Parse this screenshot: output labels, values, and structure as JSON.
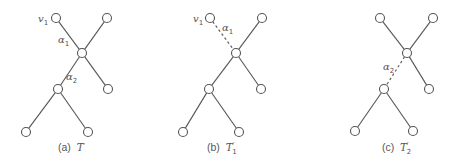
{
  "figure": {
    "node_radius": 4.5,
    "panels": [
      {
        "id": "a",
        "caption_prefix": "(a)",
        "caption_symbol": "T",
        "caption_sub": "",
        "caption_prime": "",
        "nodes": [
          {
            "id": "v1",
            "x": 56,
            "y": 18
          },
          {
            "id": "tr",
            "x": 107,
            "y": 18
          },
          {
            "id": "c",
            "x": 82,
            "y": 53
          },
          {
            "id": "rl",
            "x": 108,
            "y": 89
          },
          {
            "id": "m",
            "x": 58,
            "y": 89
          },
          {
            "id": "bl",
            "x": 26,
            "y": 132
          },
          {
            "id": "br",
            "x": 88,
            "y": 132
          }
        ],
        "edges": [
          {
            "from": "v1",
            "to": "c",
            "style": "solid"
          },
          {
            "from": "tr",
            "to": "c",
            "style": "solid"
          },
          {
            "from": "c",
            "to": "rl",
            "style": "solid"
          },
          {
            "from": "c",
            "to": "m",
            "style": "solid"
          },
          {
            "from": "m",
            "to": "bl",
            "style": "solid"
          },
          {
            "from": "m",
            "to": "br",
            "style": "solid"
          }
        ],
        "labels": [
          {
            "text": "v",
            "sub": "1",
            "x": 38,
            "y": 22
          },
          {
            "text": "α",
            "sub": "1",
            "x": 58,
            "y": 43
          },
          {
            "text": "α",
            "sub": "2",
            "x": 66,
            "y": 80
          }
        ],
        "caption_x": 58,
        "caption_y": 151
      },
      {
        "id": "b",
        "caption_prefix": "(b)",
        "caption_symbol": "T",
        "caption_sub": "1",
        "caption_prime": "′",
        "nodes": [
          {
            "id": "v1",
            "x": 210,
            "y": 18
          },
          {
            "id": "tr",
            "x": 262,
            "y": 18
          },
          {
            "id": "c",
            "x": 236,
            "y": 53
          },
          {
            "id": "rl",
            "x": 261,
            "y": 89
          },
          {
            "id": "m",
            "x": 209,
            "y": 89
          },
          {
            "id": "bl",
            "x": 183,
            "y": 132
          },
          {
            "id": "br",
            "x": 239,
            "y": 132
          }
        ],
        "edges": [
          {
            "from": "v1",
            "to": "c",
            "style": "dashed"
          },
          {
            "from": "tr",
            "to": "c",
            "style": "solid"
          },
          {
            "from": "c",
            "to": "rl",
            "style": "solid"
          },
          {
            "from": "c",
            "to": "m",
            "style": "solid"
          },
          {
            "from": "m",
            "to": "bl",
            "style": "solid"
          },
          {
            "from": "m",
            "to": "br",
            "style": "solid"
          }
        ],
        "labels": [
          {
            "text": "v",
            "sub": "1",
            "x": 193,
            "y": 22
          },
          {
            "text": "α",
            "sub": "1",
            "x": 222,
            "y": 31
          }
        ],
        "caption_x": 207,
        "caption_y": 151
      },
      {
        "id": "c",
        "caption_prefix": "(c)",
        "caption_symbol": "T",
        "caption_sub": "2",
        "caption_prime": "′",
        "nodes": [
          {
            "id": "tl",
            "x": 380,
            "y": 18
          },
          {
            "id": "tr",
            "x": 433,
            "y": 18
          },
          {
            "id": "c",
            "x": 407,
            "y": 53
          },
          {
            "id": "rl",
            "x": 429,
            "y": 89
          },
          {
            "id": "m",
            "x": 384,
            "y": 89
          },
          {
            "id": "bl",
            "x": 355,
            "y": 131
          },
          {
            "id": "br",
            "x": 413,
            "y": 131
          }
        ],
        "edges": [
          {
            "from": "tl",
            "to": "c",
            "style": "solid"
          },
          {
            "from": "tr",
            "to": "c",
            "style": "solid"
          },
          {
            "from": "c",
            "to": "rl",
            "style": "solid"
          },
          {
            "from": "c",
            "to": "m",
            "style": "dashed"
          },
          {
            "from": "m",
            "to": "bl",
            "style": "solid"
          },
          {
            "from": "m",
            "to": "br",
            "style": "solid"
          }
        ],
        "labels": [
          {
            "text": "α",
            "sub": "2",
            "x": 383,
            "y": 70
          }
        ],
        "caption_x": 382,
        "caption_y": 151
      }
    ]
  }
}
